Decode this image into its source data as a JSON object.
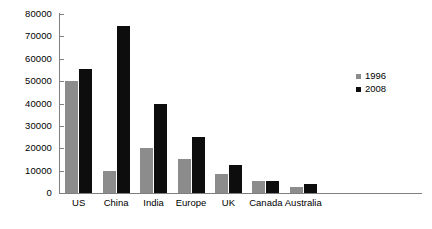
{
  "chart_data": {
    "type": "bar",
    "title": "",
    "subtitle": "",
    "xlabel": "",
    "ylabel": "",
    "ylim": [
      0,
      80000
    ],
    "yticks": [
      0,
      10000,
      20000,
      30000,
      40000,
      50000,
      60000,
      70000,
      80000
    ],
    "ytick_labels": [
      "0",
      "10000",
      "20000",
      "30000",
      "40000",
      "50000",
      "60000",
      "70000",
      "80000"
    ],
    "grid": false,
    "legend_position": "right",
    "categories": [
      "US",
      "China",
      "India",
      "Europe",
      "UK",
      "Canada",
      "Australia"
    ],
    "series": [
      {
        "name": "1996",
        "color": "#8c8c8c",
        "values": [
          50000,
          10000,
          20000,
          15000,
          8500,
          5500,
          2500
        ]
      },
      {
        "name": "2008",
        "color": "#0d0d0d",
        "values": [
          55500,
          74500,
          40000,
          25000,
          12500,
          5500,
          4000
        ]
      }
    ]
  },
  "legend": {
    "entries": [
      {
        "label": "1996",
        "swatch": "legend-swatch-1996"
      },
      {
        "label": "2008",
        "swatch": "legend-swatch-2008"
      }
    ]
  },
  "colors": {
    "series_1996": "#8c8c8c",
    "series_2008": "#0d0d0d",
    "axis": "#808080",
    "background": "#ffffff",
    "text": "#000000"
  }
}
